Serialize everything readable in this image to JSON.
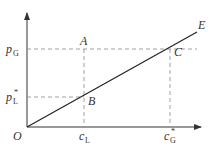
{
  "diagram": {
    "origin_label": "O",
    "line_label": "E",
    "points": {
      "A": "A",
      "B": "B",
      "C": "C"
    },
    "y_labels": {
      "pG": {
        "main": "p",
        "sub": "G",
        "sup": ""
      },
      "pL": {
        "main": "p",
        "sub": "L",
        "sup": "*"
      }
    },
    "x_labels": {
      "cL": {
        "main": "c",
        "sub": "L",
        "sup": ""
      },
      "cG": {
        "main": "c",
        "sub": "G",
        "sup": "*"
      }
    },
    "colors": {
      "axis": "#333333",
      "line": "#222222",
      "dashed": "#888888"
    }
  }
}
